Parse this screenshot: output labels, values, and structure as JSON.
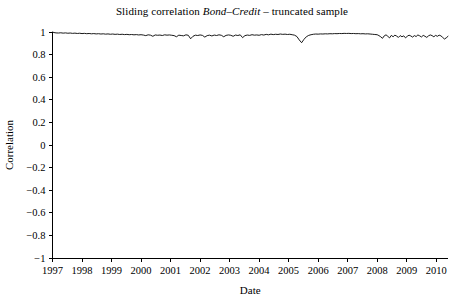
{
  "chart_data": {
    "type": "line",
    "title": "Sliding correlation Bond–Credit – truncated sample",
    "title_parts": {
      "prefix": "Sliding correlation ",
      "emphasis": "Bond–Credit",
      "suffix": " – truncated sample"
    },
    "xlabel": "Date",
    "ylabel": "Correlation",
    "xlim": [
      1997,
      2010.4
    ],
    "ylim": [
      -1,
      1
    ],
    "xticks": [
      1997,
      1998,
      1999,
      2000,
      2001,
      2002,
      2003,
      2004,
      2005,
      2006,
      2007,
      2008,
      2009,
      2010
    ],
    "xtick_labels": [
      "1997",
      "1998",
      "1999",
      "2000",
      "2001",
      "2002",
      "2003",
      "2004",
      "2005",
      "2006",
      "2007",
      "2008",
      "2009",
      "2010"
    ],
    "yticks": [
      -1,
      -0.8,
      -0.6,
      -0.4,
      -0.2,
      0,
      0.2,
      0.4,
      0.6,
      0.8,
      1
    ],
    "ytick_labels": [
      "−1",
      "−0.8",
      "−0.6",
      "−0.4",
      "−0.2",
      "0",
      "0.2",
      "0.4",
      "0.6",
      "0.8",
      "1"
    ],
    "grid": false,
    "legend": false,
    "line_color": "#000000",
    "background_color": "#ffffff",
    "series": [
      {
        "name": "Sliding correlation Bond–Credit",
        "x": [
          1997.0,
          1997.05,
          1997.12,
          1997.2,
          1997.28,
          1997.36,
          1997.44,
          1997.52,
          1997.6,
          1997.68,
          1997.76,
          1997.84,
          1997.92,
          1998.0,
          1998.08,
          1998.16,
          1998.24,
          1998.32,
          1998.4,
          1998.48,
          1998.56,
          1998.64,
          1998.72,
          1998.8,
          1998.88,
          1998.96,
          1999.04,
          1999.12,
          1999.2,
          1999.28,
          1999.36,
          1999.44,
          1999.52,
          1999.6,
          1999.68,
          1999.76,
          1999.84,
          1999.92,
          2000.0,
          2000.08,
          2000.16,
          2000.24,
          2000.32,
          2000.4,
          2000.48,
          2000.56,
          2000.64,
          2000.72,
          2000.8,
          2000.88,
          2000.96,
          2001.04,
          2001.12,
          2001.2,
          2001.28,
          2001.36,
          2001.44,
          2001.52,
          2001.6,
          2001.68,
          2001.76,
          2001.84,
          2001.92,
          2002.0,
          2002.08,
          2002.16,
          2002.24,
          2002.32,
          2002.4,
          2002.48,
          2002.56,
          2002.64,
          2002.72,
          2002.8,
          2002.88,
          2002.96,
          2003.04,
          2003.12,
          2003.2,
          2003.28,
          2003.36,
          2003.44,
          2003.52,
          2003.6,
          2003.68,
          2003.76,
          2003.84,
          2003.92,
          2004.0,
          2004.08,
          2004.16,
          2004.24,
          2004.32,
          2004.4,
          2004.48,
          2004.56,
          2004.64,
          2004.72,
          2004.8,
          2004.88,
          2004.96,
          2005.04,
          2005.12,
          2005.2,
          2005.28,
          2005.36,
          2005.44,
          2005.52,
          2005.6,
          2005.68,
          2005.76,
          2005.84,
          2005.92,
          2006.0,
          2006.08,
          2006.16,
          2006.24,
          2006.32,
          2006.4,
          2006.48,
          2006.56,
          2006.64,
          2006.72,
          2006.8,
          2006.88,
          2006.96,
          2007.04,
          2007.12,
          2007.2,
          2007.28,
          2007.36,
          2007.44,
          2007.52,
          2007.6,
          2007.68,
          2007.76,
          2007.84,
          2007.92,
          2008.0,
          2008.06,
          2008.12,
          2008.18,
          2008.24,
          2008.3,
          2008.36,
          2008.42,
          2008.48,
          2008.54,
          2008.6,
          2008.66,
          2008.72,
          2008.78,
          2008.84,
          2008.9,
          2008.96,
          2009.02,
          2009.08,
          2009.14,
          2009.2,
          2009.26,
          2009.32,
          2009.38,
          2009.44,
          2009.5,
          2009.56,
          2009.62,
          2009.68,
          2009.74,
          2009.8,
          2009.86,
          2009.92,
          2009.98,
          2010.04,
          2010.1,
          2010.16,
          2010.22,
          2010.28,
          2010.34,
          2010.4
        ],
        "values": [
          1.0,
          0.995,
          0.992,
          0.991,
          0.993,
          0.99,
          0.992,
          0.989,
          0.991,
          0.988,
          0.99,
          0.987,
          0.989,
          0.986,
          0.988,
          0.985,
          0.987,
          0.984,
          0.986,
          0.983,
          0.985,
          0.982,
          0.984,
          0.981,
          0.983,
          0.98,
          0.982,
          0.979,
          0.981,
          0.978,
          0.98,
          0.977,
          0.979,
          0.976,
          0.978,
          0.975,
          0.977,
          0.974,
          0.976,
          0.973,
          0.968,
          0.975,
          0.972,
          0.962,
          0.974,
          0.971,
          0.973,
          0.969,
          0.975,
          0.972,
          0.974,
          0.971,
          0.968,
          0.958,
          0.972,
          0.969,
          0.966,
          0.975,
          0.971,
          0.94,
          0.962,
          0.972,
          0.969,
          0.974,
          0.97,
          0.955,
          0.968,
          0.972,
          0.965,
          0.973,
          0.969,
          0.975,
          0.971,
          0.958,
          0.97,
          0.974,
          0.971,
          0.962,
          0.973,
          0.969,
          0.975,
          0.95,
          0.968,
          0.973,
          0.97,
          0.976,
          0.972,
          0.974,
          0.971,
          0.977,
          0.973,
          0.979,
          0.975,
          0.981,
          0.977,
          0.98,
          0.978,
          0.982,
          0.979,
          0.981,
          0.978,
          0.98,
          0.976,
          0.972,
          0.96,
          0.93,
          0.905,
          0.935,
          0.958,
          0.97,
          0.976,
          0.98,
          0.982,
          0.981,
          0.983,
          0.982,
          0.984,
          0.983,
          0.985,
          0.984,
          0.986,
          0.985,
          0.987,
          0.986,
          0.988,
          0.987,
          0.988,
          0.986,
          0.987,
          0.985,
          0.986,
          0.984,
          0.985,
          0.983,
          0.984,
          0.982,
          0.98,
          0.978,
          0.976,
          0.968,
          0.958,
          0.944,
          0.966,
          0.975,
          0.962,
          0.948,
          0.97,
          0.958,
          0.972,
          0.964,
          0.952,
          0.968,
          0.958,
          0.966,
          0.948,
          0.962,
          0.972,
          0.965,
          0.955,
          0.968,
          0.96,
          0.974,
          0.966,
          0.956,
          0.97,
          0.962,
          0.952,
          0.966,
          0.974,
          0.968,
          0.958,
          0.97,
          0.962,
          0.972,
          0.966,
          0.952,
          0.938,
          0.948,
          0.962
        ]
      }
    ]
  }
}
